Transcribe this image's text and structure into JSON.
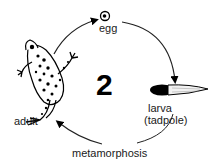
{
  "diagram": {
    "stage_number": "2",
    "stages": [
      {
        "id": "egg",
        "label": "egg"
      },
      {
        "id": "larva",
        "label": "larva",
        "sublabel": "(tadpole)"
      },
      {
        "id": "adult",
        "label": "adult"
      }
    ],
    "transition_label": "metamorphosis",
    "colors": {
      "ink": "#000000",
      "text": "#1a1a1a",
      "background": "#ffffff"
    }
  }
}
